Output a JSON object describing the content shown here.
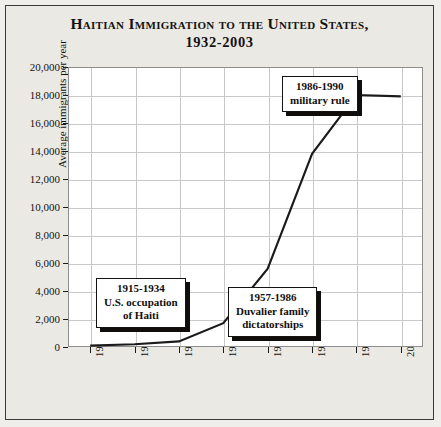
{
  "chart_data": {
    "type": "line",
    "title": "Haitian Immigration to the United States,",
    "subtitle": "1932-2003",
    "xlabel": "",
    "ylabel": "Average immigrants per year",
    "categories": [
      "1932-1940",
      "1941-1950",
      "1951-1960",
      "1961-1970",
      "1971-1980",
      "1981-1990",
      "1991-2000",
      "2001-2003"
    ],
    "values": [
      100,
      200,
      400,
      1700,
      5600,
      13800,
      18000,
      17900
    ],
    "series": [
      {
        "name": "Average immigrants per year",
        "values": [
          100,
          200,
          400,
          1700,
          5600,
          13800,
          18000,
          17900
        ]
      }
    ],
    "ylim": [
      0,
      20000
    ],
    "y_ticks": [
      0,
      2000,
      4000,
      6000,
      8000,
      10000,
      12000,
      14000,
      16000,
      18000,
      20000
    ],
    "y_tick_labels": [
      "0",
      "2,000",
      "4,000",
      "6,000",
      "8,000",
      "10,000",
      "12,000",
      "14,000",
      "16,000",
      "18,000",
      "20,000"
    ],
    "grid": true,
    "legend": "none",
    "line_color": "#1a1a1a",
    "annotations": [
      {
        "id": "occupation",
        "lines": [
          "1915-1934",
          "U.S. occupation",
          "of Haiti"
        ]
      },
      {
        "id": "duvalier",
        "lines": [
          "1957-1986",
          "Duvalier family",
          "dictatorships"
        ]
      },
      {
        "id": "military",
        "lines": [
          "1986-1990",
          "military rule"
        ]
      }
    ]
  },
  "colors": {
    "background": "#eae9e4",
    "plot_background": "#ffffff",
    "grid": "#c9c9c9",
    "ink": "#14120f",
    "frame": "#3a3a38"
  }
}
